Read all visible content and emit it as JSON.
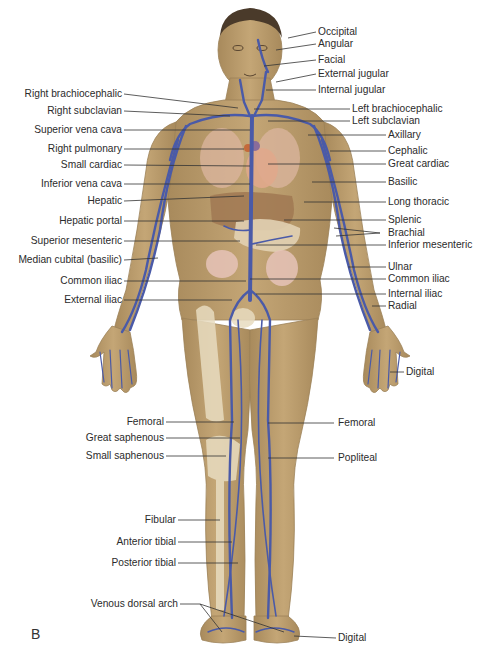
{
  "figure": {
    "panel_letter": "B",
    "colors": {
      "skin": "#b89a6a",
      "skin_light": "#d2b98c",
      "vein": "#4a5aa8",
      "bone": "#e8dcc0",
      "organ": "#d9a890",
      "leader_line": "#333333"
    }
  },
  "labels_left": [
    {
      "text": "Right brachiocephalic",
      "y": 94
    },
    {
      "text": "Right subclavian",
      "y": 111
    },
    {
      "text": "Superior vena cava",
      "y": 130
    },
    {
      "text": "Right pulmonary",
      "y": 149
    },
    {
      "text": "Small cardiac",
      "y": 165
    },
    {
      "text": "Inferior vena cava",
      "y": 184
    },
    {
      "text": "Hepatic",
      "y": 201
    },
    {
      "text": "Hepatic portal",
      "y": 221
    },
    {
      "text": "Superior mesenteric",
      "y": 241
    },
    {
      "text": "Median cubital (basilic)",
      "y": 260
    },
    {
      "text": "Common iliac",
      "y": 281
    },
    {
      "text": "External iliac",
      "y": 300
    },
    {
      "text": "Femoral",
      "y": 422
    },
    {
      "text": "Great saphenous",
      "y": 438
    },
    {
      "text": "Small saphenous",
      "y": 456
    },
    {
      "text": "Fibular",
      "y": 520
    },
    {
      "text": "Anterior tibial",
      "y": 542
    },
    {
      "text": "Posterior tibial",
      "y": 563
    },
    {
      "text": "Venous dorsal arch",
      "y": 604
    }
  ],
  "labels_right": [
    {
      "text": "Occipital",
      "y": 32
    },
    {
      "text": "Angular",
      "y": 44
    },
    {
      "text": "Facial",
      "y": 60
    },
    {
      "text": "External jugular",
      "y": 74
    },
    {
      "text": "Internal jugular",
      "y": 90
    },
    {
      "text": "Left brachiocephalic",
      "y": 109
    },
    {
      "text": "Left subclavian",
      "y": 121
    },
    {
      "text": "Axillary",
      "y": 135
    },
    {
      "text": "Cephalic",
      "y": 151
    },
    {
      "text": "Great cardiac",
      "y": 164
    },
    {
      "text": "Basilic",
      "y": 182
    },
    {
      "text": "Long thoracic",
      "y": 202
    },
    {
      "text": "Splenic",
      "y": 220
    },
    {
      "text": "Brachial",
      "y": 233
    },
    {
      "text": "Inferior mesenteric",
      "y": 245
    },
    {
      "text": "Ulnar",
      "y": 267
    },
    {
      "text": "Common iliac",
      "y": 279
    },
    {
      "text": "Internal iliac",
      "y": 294
    },
    {
      "text": "Radial",
      "y": 306
    },
    {
      "text": "Digital",
      "y": 372
    },
    {
      "text": "Femoral",
      "y": 423
    },
    {
      "text": "Popliteal",
      "y": 458
    },
    {
      "text": "Digital",
      "y": 638
    }
  ]
}
